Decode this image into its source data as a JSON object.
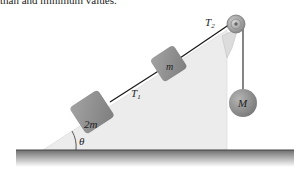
{
  "header": {
    "clipped_text": "than and minimum values."
  },
  "diagram": {
    "labels": {
      "tension_upper": "T",
      "tension_upper_sub": "2",
      "tension_lower": "T",
      "tension_lower_sub": "1",
      "block_small": "m",
      "block_large": "2m",
      "hanging_mass": "M",
      "angle": "θ"
    },
    "colors": {
      "block": "#8f8f8f",
      "incline": "#ececec",
      "rope": "#1a1a1a",
      "ground_top": "#6e6e6e",
      "ground_bottom": "#ffffff"
    }
  }
}
